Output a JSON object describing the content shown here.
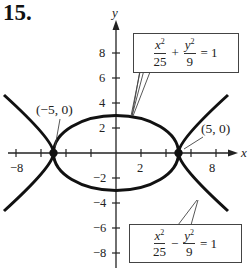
{
  "problem": {
    "number": "15."
  },
  "axes": {
    "x_label": "x",
    "y_label": "y",
    "x_ticks": [
      {
        "value": -8,
        "label": "−8"
      },
      {
        "value": 2,
        "label": "2"
      },
      {
        "value": 8,
        "label": "8"
      }
    ],
    "y_ticks": [
      {
        "value": 8,
        "label": "8"
      },
      {
        "value": 6,
        "label": "6"
      },
      {
        "value": 4,
        "label": "4"
      },
      {
        "value": 2,
        "label": "2"
      },
      {
        "value": -2,
        "label": "−2"
      },
      {
        "value": -4,
        "label": "−4"
      },
      {
        "value": -6,
        "label": "−6"
      },
      {
        "value": -8,
        "label": "−8"
      }
    ]
  },
  "points": [
    {
      "label": "(−5, 0)",
      "x": -5,
      "y": 0
    },
    {
      "label": "(5, 0)",
      "x": 5,
      "y": 0
    }
  ],
  "equations": {
    "ellipse": {
      "num1": "x",
      "exp1": "2",
      "den1": "25",
      "op": "+",
      "num2": "y",
      "exp2": "2",
      "den2": "9",
      "rhs": "= 1"
    },
    "hyperbola": {
      "num1": "x",
      "exp1": "2",
      "den1": "25",
      "op": "−",
      "num2": "y",
      "exp2": "2",
      "den2": "9",
      "rhs": "= 1"
    }
  },
  "colors": {
    "curve": "#111111",
    "axis": "#222222",
    "box_border": "#444444"
  }
}
